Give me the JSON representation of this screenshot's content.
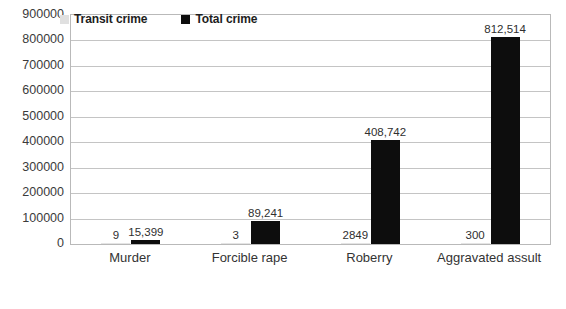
{
  "chart_data": {
    "type": "bar",
    "title": "",
    "subtitle": "",
    "xlabel": "",
    "ylabel": "",
    "categories": [
      "Murder",
      "Forcible rape",
      "Roberry",
      "Aggravated assult"
    ],
    "series": [
      {
        "name": "Transit crime",
        "color": "#e4e4e4",
        "values": [
          9,
          3,
          2849,
          300
        ],
        "labels": [
          "9",
          "3",
          "2849",
          "300"
        ]
      },
      {
        "name": "Total crime",
        "color": "#0d0d0d",
        "values": [
          15399,
          89241,
          408742,
          812514
        ],
        "labels": [
          "15,399",
          "89,241",
          "408,742",
          "812,514"
        ]
      }
    ],
    "ylim": [
      0,
      900000
    ],
    "ytick_step": 100000,
    "yticks": [
      "900000",
      "800000",
      "700000",
      "600000",
      "500000",
      "400000",
      "300000",
      "200000",
      "100000",
      "0"
    ],
    "grid": true,
    "legend_position": "top-inside"
  },
  "legend": {
    "items": [
      {
        "label": "Transit crime",
        "swatch": "transit"
      },
      {
        "label": "Total crime",
        "swatch": "total"
      }
    ]
  }
}
